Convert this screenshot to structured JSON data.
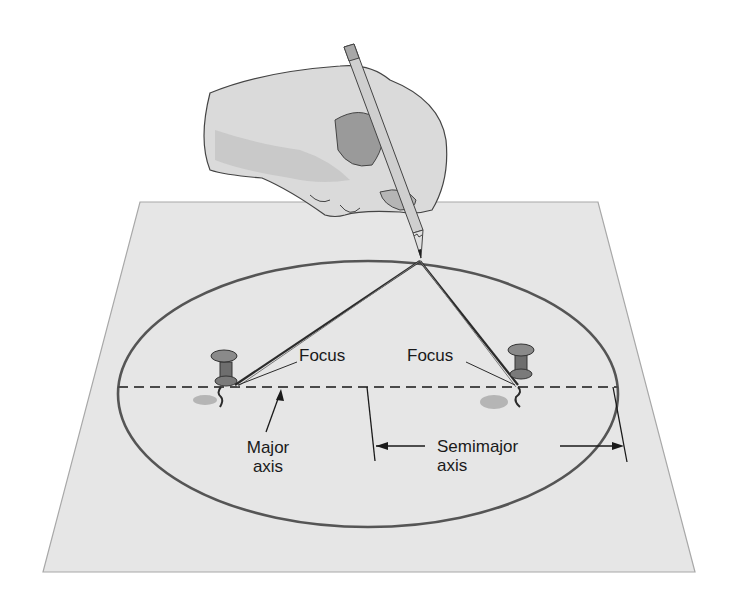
{
  "diagram": {
    "colors": {
      "background": "#ffffff",
      "paper": "#e6e6e6",
      "paper_edge": "#a8a8a8",
      "ellipse": "#555555",
      "string": "#2b2b2b",
      "pin": "#7a7a7a",
      "hand": "#d9d9d9",
      "text": "#1a1a1a"
    },
    "labels": {
      "focus_left": "Focus",
      "focus_right": "Focus",
      "major_axis_line1": "Major",
      "major_axis_line2": "axis",
      "semimajor_axis_line1": "Semimajor",
      "semimajor_axis_line2": "axis"
    },
    "elements": [
      "hand-holding-pencil",
      "paper-sheet",
      "ellipse",
      "major-axis-dashed-line",
      "left-pushpin",
      "right-pushpin",
      "string-triangle",
      "semimajor-axis-dimension"
    ]
  }
}
